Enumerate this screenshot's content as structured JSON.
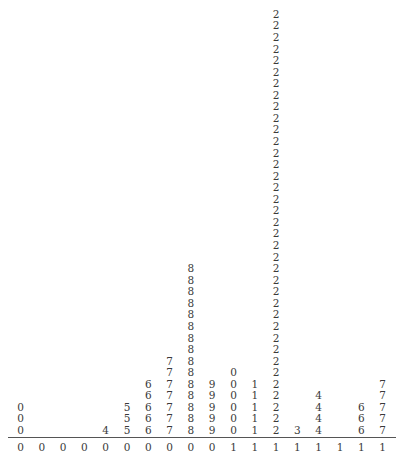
{
  "chart_data": {
    "type": "table",
    "title": "",
    "xlabel": "",
    "ylabel": "",
    "grid": false,
    "columns": [
      {
        "stem": "0",
        "leaf": "0",
        "count": 3
      },
      {
        "stem": "0",
        "leaf": "1",
        "count": 0
      },
      {
        "stem": "0",
        "leaf": "2",
        "count": 0
      },
      {
        "stem": "0",
        "leaf": "3",
        "count": 0
      },
      {
        "stem": "0",
        "leaf": "4",
        "count": 1
      },
      {
        "stem": "0",
        "leaf": "5",
        "count": 3
      },
      {
        "stem": "0",
        "leaf": "6",
        "count": 5
      },
      {
        "stem": "0",
        "leaf": "7",
        "count": 7
      },
      {
        "stem": "0",
        "leaf": "8",
        "count": 15
      },
      {
        "stem": "0",
        "leaf": "9",
        "count": 5
      },
      {
        "stem": "1",
        "leaf": "0",
        "count": 6
      },
      {
        "stem": "1",
        "leaf": "1",
        "count": 5
      },
      {
        "stem": "1",
        "leaf": "2",
        "count": 37
      },
      {
        "stem": "1",
        "leaf": "3",
        "count": 1
      },
      {
        "stem": "1",
        "leaf": "4",
        "count": 4
      },
      {
        "stem": "1",
        "leaf": "5",
        "count": 0
      },
      {
        "stem": "1",
        "leaf": "6",
        "count": 3
      },
      {
        "stem": "1",
        "leaf": "7",
        "count": 5
      }
    ],
    "categories": [
      "00",
      "01",
      "02",
      "03",
      "04",
      "05",
      "06",
      "07",
      "08",
      "09",
      "10",
      "11",
      "12",
      "13",
      "14",
      "15",
      "16",
      "17"
    ],
    "values": [
      3,
      0,
      0,
      0,
      1,
      3,
      5,
      7,
      15,
      5,
      6,
      5,
      37,
      1,
      4,
      0,
      3,
      5
    ]
  },
  "layout": {
    "x_start": 20.5,
    "x_step": 21.3,
    "baseline_center_y": 430,
    "row_step": 11.56
  }
}
